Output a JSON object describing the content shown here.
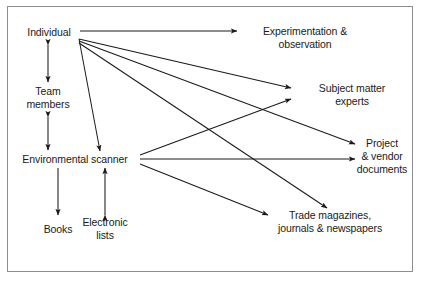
{
  "figure": {
    "border_color": "#8d8d8d",
    "line_color": "#1a1a1a",
    "background": "#ffffff"
  },
  "nodes": [
    {
      "id": "individual",
      "label": "Individual",
      "x": 49,
      "y": 32,
      "align": "center"
    },
    {
      "id": "team_members",
      "label": "Team\nmembers",
      "x": 48,
      "y": 98,
      "align": "center"
    },
    {
      "id": "env_scanner",
      "label": "Environmental scanner",
      "x": 75,
      "y": 159,
      "align": "center"
    },
    {
      "id": "books",
      "label": "Books",
      "x": 58,
      "y": 229,
      "align": "center"
    },
    {
      "id": "electronic",
      "label": "Electronic\nlists",
      "x": 105,
      "y": 229,
      "align": "center"
    },
    {
      "id": "experimentation",
      "label": "Experimentation &\nobservation",
      "x": 305,
      "y": 38,
      "align": "center"
    },
    {
      "id": "subject_matter",
      "label": "Subject matter\nexperts",
      "x": 352,
      "y": 95,
      "align": "center"
    },
    {
      "id": "project_vendor",
      "label": "Project\n& vendor\ndocuments",
      "x": 382,
      "y": 156,
      "align": "center"
    },
    {
      "id": "trade_mags",
      "label": "Trade magazines,\njournals & newspapers",
      "x": 330,
      "y": 222,
      "align": "center"
    }
  ],
  "edges": [
    {
      "id": "individual-to-experimentation",
      "from": "individual",
      "to": "experimentation",
      "x1": 80,
      "y1": 31,
      "x2": 237,
      "y2": 31,
      "arrow_end": true,
      "arrow_start": false
    },
    {
      "id": "subject-matter-to-individual",
      "from": "subject_matter",
      "to": "individual",
      "x1": 79,
      "y1": 39,
      "x2": 291,
      "y2": 88,
      "arrow_end": true,
      "arrow_start": false
    },
    {
      "id": "project-vendor-to-individual",
      "from": "project_vendor",
      "to": "individual",
      "x1": 79,
      "y1": 41,
      "x2": 355,
      "y2": 144,
      "arrow_end": true,
      "arrow_start": false
    },
    {
      "id": "trade-mags-to-individual",
      "from": "trade_mags",
      "to": "individual",
      "x1": 79,
      "y1": 43,
      "x2": 327,
      "y2": 208,
      "arrow_end": true,
      "arrow_start": false
    },
    {
      "id": "individual-to-env-scanner",
      "from": "individual",
      "to": "env_scanner",
      "x1": 79,
      "y1": 39,
      "x2": 100,
      "y2": 151,
      "arrow_end": true,
      "arrow_start": false
    },
    {
      "id": "individual-team-members",
      "from": "individual",
      "to": "team_members",
      "x1": 48,
      "y1": 45,
      "x2": 48,
      "y2": 82,
      "arrow_end": true,
      "arrow_start": true
    },
    {
      "id": "team-members-env-scanner",
      "from": "team_members",
      "to": "env_scanner",
      "x1": 48,
      "y1": 117,
      "x2": 48,
      "y2": 150,
      "arrow_end": true,
      "arrow_start": true
    },
    {
      "id": "env-scanner-to-subject-matter",
      "from": "env_scanner",
      "to": "subject_matter",
      "x1": 140,
      "y1": 155,
      "x2": 291,
      "y2": 99,
      "arrow_end": true,
      "arrow_start": false
    },
    {
      "id": "env-scanner-to-project-vendor",
      "from": "env_scanner",
      "to": "project_vendor",
      "x1": 140,
      "y1": 159,
      "x2": 355,
      "y2": 159,
      "arrow_end": true,
      "arrow_start": false
    },
    {
      "id": "env-scanner-to-trade-mags",
      "from": "env_scanner",
      "to": "trade_mags",
      "x1": 140,
      "y1": 164,
      "x2": 268,
      "y2": 215,
      "arrow_end": true,
      "arrow_start": false
    },
    {
      "id": "env-scanner-to-books",
      "from": "env_scanner",
      "to": "books",
      "x1": 58,
      "y1": 168,
      "x2": 58,
      "y2": 215,
      "arrow_end": true,
      "arrow_start": false
    },
    {
      "id": "electronic-lists-env-scanner",
      "from": "electronic",
      "to": "env_scanner",
      "x1": 105,
      "y1": 215,
      "x2": 105,
      "y2": 168,
      "arrow_end": true,
      "arrow_start": true
    }
  ]
}
